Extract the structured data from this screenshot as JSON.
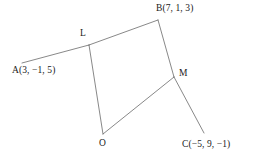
{
  "figure": {
    "type": "line-diagram",
    "background_color": "#ffffff",
    "stroke_color": "#555555",
    "stroke_width": 0.7,
    "canvas": {
      "width": 274,
      "height": 164
    },
    "points": [
      {
        "id": "A",
        "label": "A(3, −1, 5)",
        "name": "A",
        "coords_text": "(3, −1, 5)",
        "x": 3,
        "y": -1,
        "z": 5,
        "px": 22,
        "py": 63,
        "label_px": 12,
        "label_py": 66
      },
      {
        "id": "B",
        "label": "B(7, 1, 3)",
        "name": "B",
        "coords_text": "(7, 1, 3)",
        "x": 7,
        "y": 1,
        "z": 3,
        "px": 158,
        "py": 20,
        "label_px": 156,
        "label_py": 4
      },
      {
        "id": "C",
        "label": "C(−5, 9, −1)",
        "name": "C",
        "coords_text": "(−5, 9, −1)",
        "x": -5,
        "y": 9,
        "z": -1,
        "px": 204,
        "py": 133,
        "label_px": 182,
        "label_py": 140
      },
      {
        "id": "L",
        "label": "L",
        "name": "L",
        "px": 89,
        "py": 45,
        "label_px": 80,
        "label_py": 29
      },
      {
        "id": "M",
        "label": "M",
        "name": "M",
        "px": 174,
        "py": 77,
        "label_px": 179,
        "label_py": 69
      },
      {
        "id": "O",
        "label": "O",
        "name": "O",
        "px": 103,
        "py": 134,
        "label_px": 99,
        "label_py": 139
      }
    ],
    "segments": [
      {
        "id": "A-L",
        "from": "A",
        "to": "L",
        "x1": 22,
        "y1": 63,
        "x2": 89,
        "y2": 45
      },
      {
        "id": "L-B",
        "from": "L",
        "to": "B",
        "x1": 89,
        "y1": 45,
        "x2": 158,
        "y2": 20
      },
      {
        "id": "B-M",
        "from": "B",
        "to": "M",
        "x1": 158,
        "y1": 20,
        "x2": 174,
        "y2": 77
      },
      {
        "id": "M-C",
        "from": "M",
        "to": "C",
        "x1": 174,
        "y1": 77,
        "x2": 204,
        "y2": 133
      },
      {
        "id": "L-O",
        "from": "L",
        "to": "O",
        "x1": 89,
        "y1": 45,
        "x2": 103,
        "y2": 134
      },
      {
        "id": "O-M",
        "from": "O",
        "to": "M",
        "x1": 103,
        "y1": 134,
        "x2": 174,
        "y2": 77
      }
    ]
  }
}
